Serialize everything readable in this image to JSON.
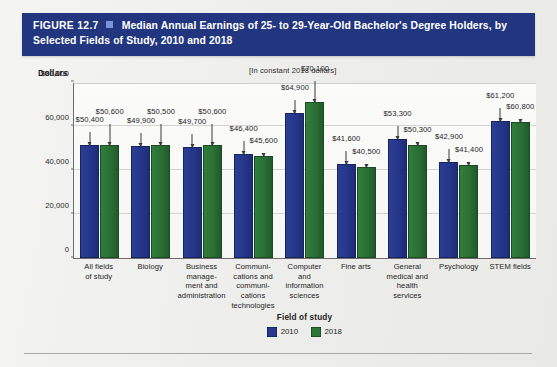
{
  "figure": {
    "number": "FIGURE 12.7",
    "title": "Median Annual Earnings of 25- to 29-Year-Old Bachelor's Degree Holders, by Selected Fields of Study, 2010 and 2018",
    "header_bg": "#223680",
    "header_text_color": "#ffffff"
  },
  "units_note": "[In constant 2018 dollars]",
  "axis": {
    "y_label": "Dollars",
    "x_title": "Field of study",
    "y_ticks": [
      "$80,000",
      "60,000",
      "40,000",
      "20,000",
      "0"
    ]
  },
  "legend": {
    "items": [
      {
        "label": "2010",
        "color": "#28398c"
      },
      {
        "label": "2018",
        "color": "#2c7738"
      }
    ]
  },
  "chart_data": {
    "type": "bar",
    "title": "Median Annual Earnings of 25- to 29-Year-Old Bachelor's Degree Holders, by Selected Fields of Study, 2010 and 2018",
    "subtitle": "[In constant 2018 dollars]",
    "xlabel": "Field of study",
    "ylabel": "Dollars",
    "ylim": [
      0,
      80000
    ],
    "ytick_values": [
      0,
      20000,
      40000,
      60000,
      80000
    ],
    "grid": true,
    "legend_position": "bottom",
    "categories": [
      "All fields of study",
      "Biology",
      "Business management and administration",
      "Communications and communications technologies",
      "Computer and information sciences",
      "Fine arts",
      "General medical and health services",
      "Psychology",
      "STEM fields"
    ],
    "category_lines": [
      [
        "All fields",
        "of study"
      ],
      [
        "Biology"
      ],
      [
        "Business",
        "manage-",
        "ment and",
        "administration"
      ],
      [
        "Communi-",
        "cations and",
        "communi-",
        "cations",
        "technologies"
      ],
      [
        "Computer",
        "and",
        "information",
        "sciences"
      ],
      [
        "Fine arts"
      ],
      [
        "General",
        "medical and",
        "health services"
      ],
      [
        "Psychology"
      ],
      [
        "STEM fields"
      ]
    ],
    "series": [
      {
        "name": "2010",
        "color": "#28398c",
        "values": [
          50400,
          49900,
          49700,
          46400,
          64900,
          41600,
          53300,
          42900,
          61200
        ],
        "labels": [
          "$50,400",
          "$49,900",
          "$49,700",
          "$46,400",
          "$64,900",
          "$41,600",
          "$53,300",
          "$42,900",
          "$61,200"
        ]
      },
      {
        "name": "2018",
        "color": "#2c7738",
        "values": [
          50600,
          50500,
          50600,
          45600,
          70100,
          40500,
          50300,
          41400,
          60800
        ],
        "labels": [
          "$50,600",
          "$50,500",
          "$50,600",
          "$45,600",
          "$70,100",
          "$40,500",
          "$50,300",
          "$41,400",
          "$60,800"
        ]
      }
    ]
  }
}
